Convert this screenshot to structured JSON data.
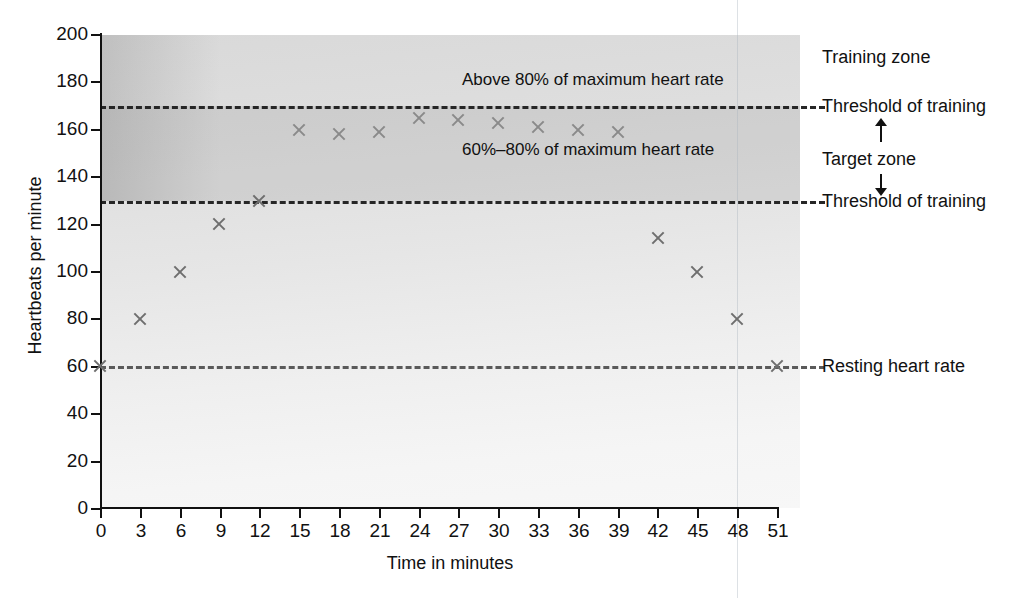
{
  "chart_data": {
    "type": "scatter",
    "title": "",
    "xlabel": "Time in minutes",
    "ylabel": "Heartbeats per minute",
    "xlim": [
      0,
      51
    ],
    "ylim": [
      0,
      200
    ],
    "grid": false,
    "legend_position": "right",
    "x": [
      0,
      3,
      6,
      9,
      12,
      15,
      18,
      21,
      24,
      27,
      30,
      33,
      36,
      39,
      42,
      45,
      48,
      51
    ],
    "values": [
      60,
      80,
      100,
      120,
      130,
      160,
      158,
      159,
      165,
      164,
      163,
      161,
      160,
      159,
      114,
      100,
      80,
      60
    ],
    "series": [
      {
        "name": "Heart rate",
        "marker": "x",
        "values": [
          60,
          80,
          100,
          120,
          130,
          160,
          158,
          159,
          165,
          164,
          163,
          161,
          160,
          159,
          114,
          100,
          80,
          60
        ]
      }
    ],
    "x_ticks": [
      "0",
      "3",
      "6",
      "9",
      "12",
      "15",
      "18",
      "21",
      "24",
      "27",
      "30",
      "33",
      "36",
      "39",
      "42",
      "45",
      "48",
      "51"
    ],
    "y_ticks": [
      "0",
      "20",
      "40",
      "60",
      "80",
      "100",
      "120",
      "140",
      "160",
      "180",
      "200"
    ],
    "reference_lines": [
      {
        "value": 170,
        "label": "Threshold of training",
        "style": "dashed"
      },
      {
        "value": 130,
        "label": "Threshold of training",
        "style": "dashed"
      },
      {
        "value": 60,
        "label": "Resting heart rate",
        "style": "dashed"
      }
    ],
    "bands": [
      {
        "from": 170,
        "to": 200,
        "label": "Above 80% of maximum heart rate",
        "name": "Training zone"
      },
      {
        "from": 130,
        "to": 170,
        "label": "60%–80% of maximum heart rate",
        "name": "Target zone"
      }
    ],
    "annotations": [
      {
        "text": "Above 80% of maximum heart rate",
        "x": 30,
        "y": 180
      },
      {
        "text": "60%–80% of maximum heart rate",
        "x": 30,
        "y": 148
      }
    ]
  },
  "axes": {
    "x_title": "Time in minutes",
    "y_title": "Heartbeats per minute",
    "x_ticks": [
      "0",
      "3",
      "6",
      "9",
      "12",
      "15",
      "18",
      "21",
      "24",
      "27",
      "30",
      "33",
      "36",
      "39",
      "42",
      "45",
      "48",
      "51"
    ],
    "y_ticks": [
      "200",
      "180",
      "160",
      "140",
      "120",
      "100",
      "80",
      "60",
      "40",
      "20",
      "0"
    ]
  },
  "plot_notes": {
    "above80": "Above 80% of maximum heart rate",
    "range6080": "60%–80% of maximum heart rate"
  },
  "side_notes": {
    "training_zone": "Training zone",
    "threshold_upper": "Threshold of training",
    "target_zone": "Target zone",
    "threshold_lower": "Threshold of training",
    "resting": "Resting heart rate"
  },
  "colors": {
    "marker": "#8a8a8a",
    "axis": "#111111",
    "dash": "#262626",
    "target_band": "#c9c9c9",
    "plot_bg": "#e6e6e6"
  }
}
